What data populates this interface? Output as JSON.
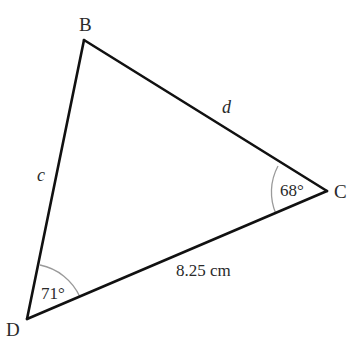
{
  "diagram": {
    "type": "triangle",
    "vertices": {
      "B": {
        "label": "B",
        "x": 84,
        "y": 40
      },
      "C": {
        "label": "C",
        "x": 327,
        "y": 191
      },
      "D": {
        "label": "D",
        "x": 27,
        "y": 319
      }
    },
    "sides": {
      "BD": {
        "label": "c"
      },
      "BC": {
        "label": "d"
      },
      "DC": {
        "label": "8.25 cm"
      }
    },
    "angles": {
      "C": {
        "label": "68°"
      },
      "D": {
        "label": "71°"
      }
    },
    "colors": {
      "line": "#111111",
      "arc": "#999999",
      "text": "#2a2a2a"
    }
  }
}
